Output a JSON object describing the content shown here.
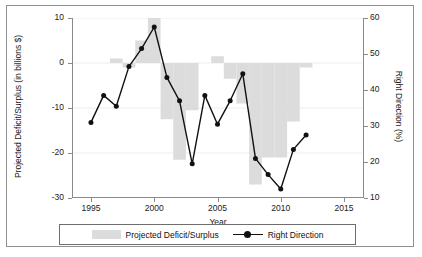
{
  "chart_data": {
    "type": "bar",
    "title": "",
    "xlabel": "Year",
    "ylabel": "Projected Deficit/Surplus (in billions $)",
    "y2label": "Right Direction (%)",
    "xlim": [
      1993.5,
      2016.5
    ],
    "ylim": [
      -30,
      10
    ],
    "y2lim": [
      10,
      60
    ],
    "grid": true,
    "legend_position": "bottom",
    "x_ticks": [
      "1995",
      "2000",
      "2005",
      "2010",
      "2015"
    ],
    "x_tick_values": [
      1995,
      2000,
      2005,
      2010,
      2015
    ],
    "y_ticks": [
      "10",
      "0",
      "-10",
      "-20",
      "-30"
    ],
    "y_tick_values": [
      10,
      0,
      -10,
      -20,
      -30
    ],
    "y2_ticks": [
      "60",
      "50",
      "40",
      "30",
      "20",
      "10"
    ],
    "y2_tick_values": [
      60,
      50,
      40,
      30,
      20,
      10
    ],
    "categories": [
      1995,
      1996,
      1997,
      1998,
      1999,
      2000,
      2001,
      2002,
      2003,
      2004,
      2005,
      2006,
      2007,
      2008,
      2009,
      2010,
      2011,
      2012
    ],
    "series": [
      {
        "name": "Projected Deficit/Surplus",
        "type": "bar",
        "axis": "left",
        "unit": "billions $",
        "color": "#dcdcdc",
        "values": [
          0,
          0,
          1,
          -1,
          5,
          10,
          -12.5,
          -21.5,
          -10.5,
          0,
          1.5,
          -3.5,
          -9,
          -27,
          -21,
          -21,
          -13,
          -1
        ]
      },
      {
        "name": "Right Direction",
        "type": "line",
        "axis": "right",
        "unit": "%",
        "color": "#111111",
        "marker": "circle",
        "values": [
          31,
          38.5,
          35.5,
          46.5,
          51.5,
          57.5,
          43.5,
          37,
          19.5,
          38.5,
          30.5,
          37,
          44.5,
          21,
          16.5,
          12.5,
          23.5,
          27.5
        ]
      }
    ]
  },
  "legend": {
    "bar_label": "Projected Deficit/Surplus",
    "line_label": "Right Direction"
  }
}
